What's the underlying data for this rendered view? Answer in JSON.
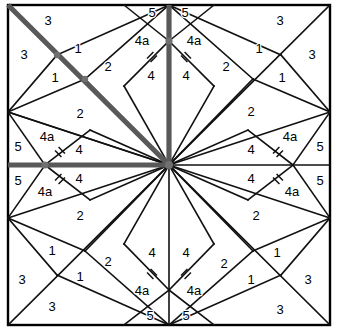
{
  "figure": {
    "name": "pieced-block-pattern",
    "width": 338,
    "height": 336,
    "background_color": "#ffffff",
    "line_color": "#111111",
    "guide_color": "#595959",
    "node_color": "#707070",
    "symmetry": "four-fold mirror (vertical and horizontal axes)"
  },
  "frame": {
    "left": 8,
    "top": 5,
    "right": 330,
    "bottom": 325,
    "center_x": 169,
    "center_y": 165
  },
  "nodes": [
    {
      "name": "center-node",
      "x": 169,
      "y": 165
    },
    {
      "name": "top-mid-node",
      "x": 169,
      "y": 41
    },
    {
      "name": "bottom-mid-node",
      "x": 169,
      "y": 290
    },
    {
      "name": "left-mid-node",
      "x": 45,
      "y": 165
    },
    {
      "name": "right-mid-node",
      "x": 293,
      "y": 165
    },
    {
      "name": "upper-left-diagonal-node",
      "x": 57,
      "y": 55
    },
    {
      "name": "upper-left-inner-node",
      "x": 85,
      "y": 79
    }
  ],
  "guides": [
    {
      "name": "diagonal-guide",
      "from": [
        8,
        5
      ],
      "to": [
        169,
        165
      ]
    },
    {
      "name": "vertical-guide",
      "from": [
        169,
        5
      ],
      "to": [
        169,
        165
      ]
    },
    {
      "name": "horizontal-guide",
      "from": [
        8,
        165
      ],
      "to": [
        169,
        165
      ]
    }
  ],
  "labels": {
    "piece_1": "1",
    "piece_2": "2",
    "piece_3": "3",
    "piece_4": "4",
    "piece_4a": "4a",
    "piece_5": "5"
  },
  "label_placements": [
    {
      "id": "q1-3-top",
      "text": "3",
      "x": 48,
      "y": 22
    },
    {
      "id": "q1-3-left",
      "text": "3",
      "x": 24,
      "y": 56
    },
    {
      "id": "q1-1-upper",
      "text": "1",
      "x": 78,
      "y": 50
    },
    {
      "id": "q1-1-lower",
      "text": "1",
      "x": 55,
      "y": 79
    },
    {
      "id": "q1-2-upper",
      "text": "2",
      "x": 108,
      "y": 68
    },
    {
      "id": "q1-2-lower",
      "text": "2",
      "x": 80,
      "y": 115
    },
    {
      "id": "q1-5-top",
      "text": "5",
      "x": 152,
      "y": 14
    },
    {
      "id": "q1-4a-top",
      "text": "4a",
      "x": 142,
      "y": 42
    },
    {
      "id": "q1-4-top",
      "text": "4",
      "x": 151,
      "y": 77
    },
    {
      "id": "q1-5-left",
      "text": "5",
      "x": 18,
      "y": 148
    },
    {
      "id": "q1-4a-left",
      "text": "4a",
      "x": 47,
      "y": 138
    },
    {
      "id": "q1-4-left",
      "text": "4",
      "x": 79,
      "y": 151
    },
    {
      "id": "q2-3-top",
      "text": "3",
      "x": 280,
      "y": 22
    },
    {
      "id": "q2-3-right",
      "text": "3",
      "x": 312,
      "y": 56
    },
    {
      "id": "q2-1-upper",
      "text": "1",
      "x": 259,
      "y": 50
    },
    {
      "id": "q2-1-lower",
      "text": "1",
      "x": 282,
      "y": 79
    },
    {
      "id": "q2-2-upper",
      "text": "2",
      "x": 226,
      "y": 68
    },
    {
      "id": "q2-2-lower",
      "text": "2",
      "x": 251,
      "y": 113
    },
    {
      "id": "q2-5-top",
      "text": "5",
      "x": 185,
      "y": 14
    },
    {
      "id": "q2-4a-top",
      "text": "4a",
      "x": 194,
      "y": 42
    },
    {
      "id": "q2-4-top",
      "text": "4",
      "x": 186,
      "y": 77
    },
    {
      "id": "q2-5-right",
      "text": "5",
      "x": 320,
      "y": 148
    },
    {
      "id": "q2-4a-right",
      "text": "4a",
      "x": 290,
      "y": 138
    },
    {
      "id": "q2-4-right",
      "text": "4",
      "x": 251,
      "y": 151
    },
    {
      "id": "q3-5-left",
      "text": "5",
      "x": 18,
      "y": 182
    },
    {
      "id": "q3-4a-left",
      "text": "4a",
      "x": 45,
      "y": 193
    },
    {
      "id": "q3-4-left",
      "text": "4",
      "x": 79,
      "y": 180
    },
    {
      "id": "q3-2-upper",
      "text": "2",
      "x": 80,
      "y": 217
    },
    {
      "id": "q3-1-upper",
      "text": "1",
      "x": 52,
      "y": 252
    },
    {
      "id": "q3-1-lower",
      "text": "1",
      "x": 80,
      "y": 278
    },
    {
      "id": "q3-2-lower",
      "text": "2",
      "x": 108,
      "y": 263
    },
    {
      "id": "q3-3-left",
      "text": "3",
      "x": 22,
      "y": 281
    },
    {
      "id": "q3-3-bot",
      "text": "3",
      "x": 52,
      "y": 308
    },
    {
      "id": "q3-4-bot",
      "text": "4",
      "x": 152,
      "y": 254
    },
    {
      "id": "q3-4a-bot",
      "text": "4a",
      "x": 142,
      "y": 292
    },
    {
      "id": "q3-5-bot",
      "text": "5",
      "x": 150,
      "y": 317
    },
    {
      "id": "q4-5-right",
      "text": "5",
      "x": 320,
      "y": 182
    },
    {
      "id": "q4-4a-right",
      "text": "4a",
      "x": 292,
      "y": 193
    },
    {
      "id": "q4-4-right",
      "text": "4",
      "x": 251,
      "y": 180
    },
    {
      "id": "q4-2-upper",
      "text": "2",
      "x": 256,
      "y": 217
    },
    {
      "id": "q4-1-upper",
      "text": "1",
      "x": 277,
      "y": 254
    },
    {
      "id": "q4-1-lower",
      "text": "1",
      "x": 251,
      "y": 281
    },
    {
      "id": "q4-2-lower",
      "text": "2",
      "x": 224,
      "y": 265
    },
    {
      "id": "q4-3-right",
      "text": "3",
      "x": 308,
      "y": 281
    },
    {
      "id": "q4-3-bot",
      "text": "3",
      "x": 280,
      "y": 311
    },
    {
      "id": "q4-4-bot",
      "text": "4",
      "x": 186,
      "y": 254
    },
    {
      "id": "q4-4a-bot",
      "text": "4a",
      "x": 194,
      "y": 292
    },
    {
      "id": "q4-5-bot",
      "text": "5",
      "x": 186,
      "y": 317
    }
  ],
  "tick_marks": [
    {
      "id": "tick-top-left",
      "x": 152,
      "y": 57,
      "angle": 45
    },
    {
      "id": "tick-top-right",
      "x": 186,
      "y": 57,
      "angle": -45
    },
    {
      "id": "tick-left-upper",
      "x": 58,
      "y": 152,
      "angle": -45
    },
    {
      "id": "tick-left-lower",
      "x": 58,
      "y": 179,
      "angle": 45
    },
    {
      "id": "tick-right-upper",
      "x": 280,
      "y": 152,
      "angle": 45
    },
    {
      "id": "tick-right-lower",
      "x": 280,
      "y": 179,
      "angle": -45
    },
    {
      "id": "tick-bottom-left",
      "x": 152,
      "y": 274,
      "angle": -45
    },
    {
      "id": "tick-bottom-right",
      "x": 186,
      "y": 274,
      "angle": 45
    }
  ]
}
